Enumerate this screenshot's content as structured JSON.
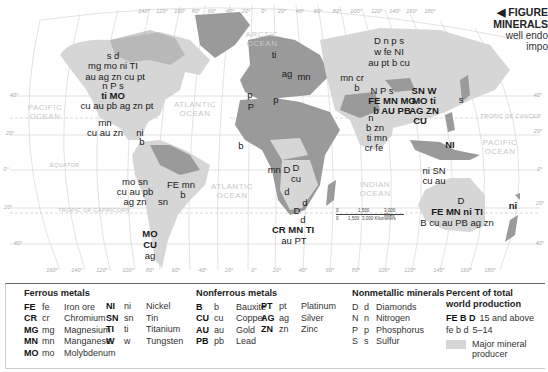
{
  "figure_title": {
    "line1": "◀ FIGURE",
    "line2": "MINERALS",
    "line3": "well endo",
    "line4": "impo"
  },
  "oceans": {
    "arctic": "ARCTIC OCEAN",
    "pacific_east": "PACIFIC OCEAN",
    "atlantic_north": "ATLANTIC OCEAN",
    "atlantic_south": "ATLANTIC OCEAN",
    "indian": "INDIAN OCEAN",
    "pacific_west": "PACIFIC OCEAN"
  },
  "geo_lines": {
    "equator": "EQUATOR",
    "tropic_capricorn": "TROPIC OF CAPRICORN",
    "tropic_cancer": "TROPIC OF CANCER"
  },
  "lat_labels": [
    "40°",
    "20°",
    "0°",
    "20°",
    "40°"
  ],
  "lon_labels_bottom": [
    "160°",
    "140°",
    "120°",
    "100°",
    "80°",
    "60°",
    "40°",
    "20°",
    "0°",
    "20°",
    "40°",
    "60°",
    "80°",
    "100°",
    "120°",
    "140°",
    "160°",
    "180°"
  ],
  "lon_labels_top": [
    "140°",
    "120°",
    "100°",
    "80°",
    "60°",
    "40°",
    "20°",
    "0°",
    "20°",
    "40°",
    "60°",
    "80°",
    "100°",
    "120°",
    "140°",
    "160°",
    "180°"
  ],
  "scale_bar": {
    "miles": [
      "0",
      "1,500",
      "3,000 Miles"
    ],
    "km": [
      "0",
      "1,500",
      "3,000 Kilometers"
    ]
  },
  "region_labels": {
    "canada_1": "s d",
    "canada_2": "mg mo ni TI",
    "canada_3": "au ag zn cu pt",
    "usa_1": "n P s",
    "usa_2": "ti MO",
    "usa_3": "cu au pb ag zn pt",
    "mexico_1": "mn",
    "mexico_2": "cu au zn",
    "caribbean_1": "ni",
    "caribbean_2": "b",
    "andes_1": "mo sn",
    "andes_2": "cu au pb",
    "andes_3": "ag zn",
    "brazil_1": "FE mn",
    "brazil_2": "b",
    "bolivia": "sn",
    "chile_1": "MO",
    "chile_2": "CU",
    "chile_3": "ag",
    "scandinavia": "ti",
    "europe_ag": "ag",
    "europe_mn": "mn",
    "spain": "p",
    "morocco": "P",
    "tunisia": "p",
    "west_africa": "b",
    "central_africa_1": "mn D",
    "central_africa_2": "D",
    "central_africa_3": "cu",
    "angola": "d",
    "botswana_1": "d",
    "botswana_2": "D",
    "botswana_3": "d",
    "south_africa_1": "CR MN TI",
    "south_africa_2": "au PT",
    "kazakh_1": "mn cr",
    "kazakh_2": "b",
    "russia_1": "D n p s",
    "russia_2": "w fe NI",
    "russia_3": "au pt b cu",
    "china_1": "N P s",
    "china_2": "FE MN MG",
    "china_3": "b AU PB",
    "china_4": "SN W",
    "china_5": "MO ti",
    "china_6": "AG ZN",
    "china_7": "CU",
    "japan": "s",
    "india_1": "n",
    "india_2": "b zn",
    "india_3": "ti mn",
    "india_4": "cr fe",
    "philippines": "NI",
    "indonesia_1": "ni SN",
    "indonesia_2": "cu au",
    "australia_1": "D",
    "australia_2": "FE MN ni TI",
    "australia_3": "B cu au PB ag zn",
    "new_caledonia": "ni"
  },
  "legend": {
    "ferrous": {
      "title": "Ferrous metals",
      "items": [
        {
          "upper": "FE",
          "lower": "fe",
          "name": "Iron ore"
        },
        {
          "upper": "CR",
          "lower": "cr",
          "name": "Chromium"
        },
        {
          "upper": "MG",
          "lower": "mg",
          "name": "Magnesium"
        },
        {
          "upper": "MN",
          "lower": "mn",
          "name": "Manganese"
        },
        {
          "upper": "MO",
          "lower": "mo",
          "name": "Molybdenum"
        },
        {
          "upper": "NI",
          "lower": "ni",
          "name": "Nickel"
        },
        {
          "upper": "SN",
          "lower": "sn",
          "name": "Tin"
        },
        {
          "upper": "TI",
          "lower": "ti",
          "name": "Titanium"
        },
        {
          "upper": "W",
          "lower": "w",
          "name": "Tungsten"
        }
      ]
    },
    "nonferrous": {
      "title": "Nonferrous metals",
      "items": [
        {
          "upper": "B",
          "lower": "b",
          "name": "Bauxite"
        },
        {
          "upper": "CU",
          "lower": "cu",
          "name": "Copper"
        },
        {
          "upper": "AU",
          "lower": "au",
          "name": "Gold"
        },
        {
          "upper": "PB",
          "lower": "pb",
          "name": "Lead"
        },
        {
          "upper": "PT",
          "lower": "pt",
          "name": "Platinum"
        },
        {
          "upper": "AG",
          "lower": "ag",
          "name": "Silver"
        },
        {
          "upper": "ZN",
          "lower": "zn",
          "name": "Zinc"
        }
      ]
    },
    "nonmetallic": {
      "title": "Nonmetallic minerals",
      "items": [
        {
          "upper": "D",
          "lower": "d",
          "name": "Diamonds"
        },
        {
          "upper": "N",
          "lower": "n",
          "name": "Nitrogen"
        },
        {
          "upper": "P",
          "lower": "p",
          "name": "Phosphorus"
        },
        {
          "upper": "S",
          "lower": "s",
          "name": "Sulfur"
        }
      ]
    },
    "percent": {
      "title_1": "Percent of total",
      "title_2": "world production",
      "high_symbols": "FE B D",
      "high_label": "15 and above",
      "low_symbols": "fe b d",
      "low_label": "5–14",
      "swatch_label_1": "Major mineral",
      "swatch_label_2": "producer",
      "swatch_color": "#d6d6d6"
    }
  },
  "colors": {
    "land": "#9a9a9a",
    "producer": "#d6d6d6",
    "ocean": "#ffffff",
    "grid": "#c9c9c9"
  }
}
